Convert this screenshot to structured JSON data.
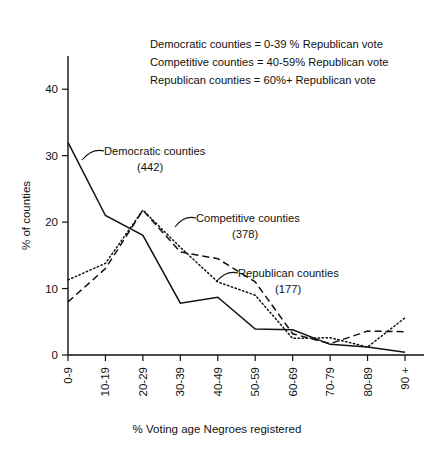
{
  "chart_data": {
    "type": "line",
    "title": "",
    "xlabel": "% Voting age Negroes registered",
    "ylabel": "% of counties",
    "categories": [
      "0-9",
      "10-19",
      "20-29",
      "30-39",
      "40-49",
      "50-59",
      "60-69",
      "70-79",
      "80-89",
      "90 +"
    ],
    "ylim": [
      0,
      45
    ],
    "yticks": [
      0,
      10,
      20,
      30,
      40
    ],
    "ytick_labels": [
      "0",
      "10",
      "20",
      "30",
      "40"
    ],
    "grid": false,
    "legend_position": "inline-annotations",
    "series": [
      {
        "name": "Democratic counties",
        "count": "(442)",
        "style": "solid",
        "values": [
          32.0,
          21.0,
          18.0,
          7.8,
          8.7,
          3.9,
          3.8,
          1.6,
          1.2,
          0.4
        ]
      },
      {
        "name": "Competitive counties",
        "count": "(378)",
        "style": "dotted",
        "values": [
          11.3,
          13.8,
          21.8,
          16.2,
          11.0,
          9.0,
          2.5,
          2.6,
          1.2,
          5.6
        ]
      },
      {
        "name": "Republican counties",
        "count": "(177)",
        "style": "dashed",
        "values": [
          8.0,
          13.0,
          21.8,
          15.5,
          14.5,
          11.0,
          3.2,
          1.7,
          3.6,
          3.5
        ]
      }
    ],
    "definitions": [
      "Democratic counties = 0-39 % Republican vote",
      "Competitive counties = 40-59%  Republican vote",
      "Republican counties = 60%+ Republican vote"
    ],
    "annotations": [
      {
        "label": "Democratic counties",
        "count": "(442)"
      },
      {
        "label": "Competitive counties",
        "count": "(378)"
      },
      {
        "label": "Republican counties",
        "count": "(177)"
      }
    ]
  }
}
